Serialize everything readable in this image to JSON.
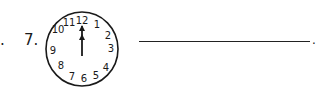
{
  "question": {
    "lead_mark": ".",
    "number": "7.",
    "clock": {
      "numbers": [
        "12",
        "1",
        "2",
        "3",
        "4",
        "5",
        "6",
        "7",
        "8",
        "9",
        "10",
        "11"
      ],
      "hour_hand_points_to": 12,
      "minute_hand_points_to": 12,
      "displayed_time": "12:00"
    },
    "answer_value": "",
    "end_mark": "."
  }
}
